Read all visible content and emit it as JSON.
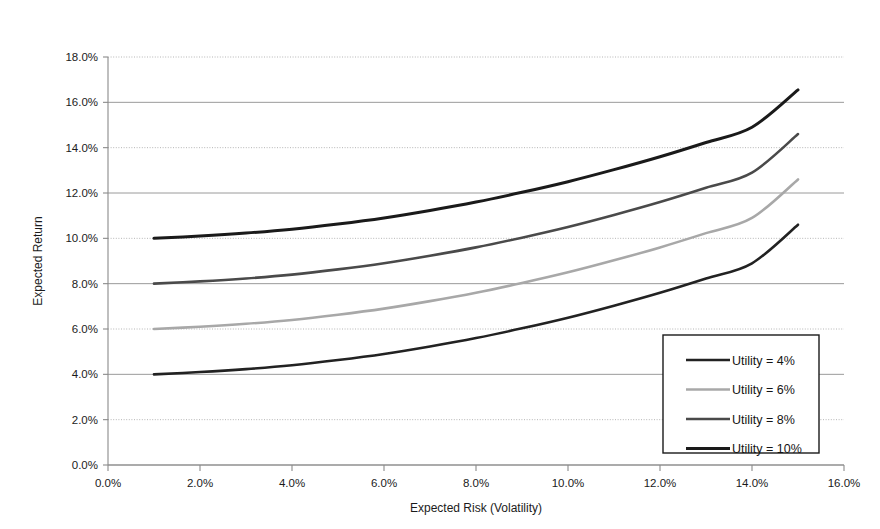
{
  "chart_data": {
    "type": "line",
    "title": "",
    "xlabel": "Expected Risk (Volatility)",
    "ylabel": "Expected Return",
    "xlim": [
      0.0,
      16.0
    ],
    "ylim": [
      0.0,
      18.0
    ],
    "xtick_labels": [
      "0.0%",
      "2.0%",
      "4.0%",
      "6.0%",
      "8.0%",
      "10.0%",
      "12.0%",
      "14.0%",
      "16.0%"
    ],
    "xtick_values": [
      0.0,
      2.0,
      4.0,
      6.0,
      8.0,
      10.0,
      12.0,
      14.0,
      16.0
    ],
    "ytick_labels": [
      "0.0%",
      "2.0%",
      "4.0%",
      "6.0%",
      "8.0%",
      "10.0%",
      "12.0%",
      "14.0%",
      "16.0%",
      "18.0%"
    ],
    "ytick_values": [
      0.0,
      2.0,
      4.0,
      6.0,
      8.0,
      10.0,
      12.0,
      14.0,
      16.0,
      18.0
    ],
    "grid": true,
    "grid_style_note": "horizontal gridlines only; alternating solid and dotted",
    "legend_position": "lower-right-inside",
    "units": "percent",
    "x": [
      1.0,
      2.0,
      3.0,
      4.0,
      5.0,
      6.0,
      7.0,
      8.0,
      9.0,
      10.0,
      11.0,
      12.0,
      13.0,
      14.0,
      15.0
    ],
    "series": [
      {
        "name": "Utility = 4%",
        "values": [
          4.0,
          4.1,
          4.23,
          4.4,
          4.63,
          4.9,
          5.23,
          5.6,
          6.03,
          6.5,
          7.03,
          7.6,
          8.23,
          8.9,
          10.6
        ],
        "color": "#222222",
        "width": 2.6
      },
      {
        "name": "Utility = 6%",
        "values": [
          6.0,
          6.1,
          6.23,
          6.4,
          6.63,
          6.9,
          7.23,
          7.6,
          8.03,
          8.5,
          9.03,
          9.6,
          10.23,
          10.9,
          12.6
        ],
        "color": "#a8a8a8",
        "width": 2.6
      },
      {
        "name": "Utility = 8%",
        "values": [
          8.0,
          8.1,
          8.23,
          8.4,
          8.63,
          8.9,
          9.23,
          9.6,
          10.03,
          10.5,
          11.03,
          11.6,
          12.23,
          12.9,
          14.6
        ],
        "color": "#4a4a4a",
        "width": 2.6
      },
      {
        "name": "Utility = 10%",
        "values": [
          10.0,
          10.1,
          10.23,
          10.4,
          10.63,
          10.9,
          11.23,
          11.6,
          12.03,
          12.5,
          13.03,
          13.6,
          14.23,
          14.9,
          16.55
        ],
        "color": "#1a1a1a",
        "width": 3.0
      }
    ]
  },
  "legend": {
    "entries": [
      {
        "label": "Utility = 4%"
      },
      {
        "label": "Utility = 6%"
      },
      {
        "label": "Utility = 8%"
      },
      {
        "label": "Utility = 10%"
      }
    ]
  },
  "colors": {
    "background": "#ffffff",
    "axis": "#8a8a8a",
    "gridline_solid": "#9a9a9a",
    "gridline_dotted": "#b5b5b5",
    "legend_border": "#1a1a1a",
    "text": "#1a1a1a"
  }
}
